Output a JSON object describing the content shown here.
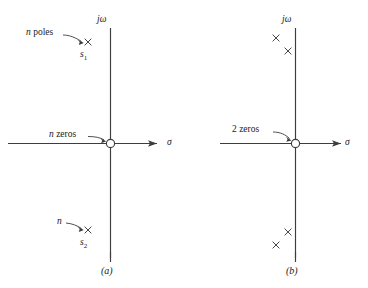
{
  "figure": {
    "ink_color": "#3d3d3d",
    "background_color": "#ffffff"
  },
  "panels": [
    {
      "id": "panel-a",
      "caption": "(a)",
      "axes": {
        "vertical_label": "jω",
        "horizontal_label": "σ"
      },
      "annotations": [
        {
          "id": "n-poles",
          "text": "n poles",
          "italic_part": "n",
          "roman_part": "poles"
        },
        {
          "id": "n-zeros",
          "text": "n zeros",
          "italic_part": "n",
          "roman_part": "zeros"
        },
        {
          "id": "n-lower",
          "text": "n",
          "italic_part": "n",
          "roman_part": ""
        }
      ],
      "points": [
        {
          "id": "s1",
          "label": "s",
          "subscript": "1",
          "marker": "cross",
          "quadrant": "upper-left"
        },
        {
          "id": "s2",
          "label": "s",
          "subscript": "2",
          "marker": "cross",
          "quadrant": "lower-left"
        },
        {
          "id": "origin-zeros",
          "label": "",
          "subscript": "",
          "marker": "circle",
          "quadrant": "origin"
        }
      ],
      "pole_count_text": "n",
      "zero_count_text": "n"
    },
    {
      "id": "panel-b",
      "caption": "(b)",
      "axes": {
        "vertical_label": "jω",
        "horizontal_label": "σ"
      },
      "annotations": [
        {
          "id": "two-zeros",
          "text": "2 zeros",
          "italic_part": "",
          "roman_part": "2 zeros"
        }
      ],
      "points": [
        {
          "id": "p1",
          "label": "",
          "subscript": "",
          "marker": "cross",
          "quadrant": "upper-left"
        },
        {
          "id": "p2",
          "label": "",
          "subscript": "",
          "marker": "cross",
          "quadrant": "upper-left"
        },
        {
          "id": "p3",
          "label": "",
          "subscript": "",
          "marker": "cross",
          "quadrant": "lower-left"
        },
        {
          "id": "p4",
          "label": "",
          "subscript": "",
          "marker": "cross",
          "quadrant": "lower-left"
        },
        {
          "id": "origin-zeros",
          "label": "",
          "subscript": "",
          "marker": "circle",
          "quadrant": "origin"
        }
      ],
      "pole_count_text": "4",
      "zero_count_text": "2"
    }
  ],
  "labels": {
    "a_n_poles_italic": "n",
    "a_n_poles_roman": "poles",
    "a_n_zeros_italic": "n",
    "a_n_zeros_roman": "zeros",
    "a_n_lower": "n",
    "a_s1_base": "s",
    "a_s1_sub": "1",
    "a_s2_base": "s",
    "a_s2_sub": "2",
    "a_jomega": "jω",
    "a_sigma": "σ",
    "a_caption": "(a)",
    "b_two_zeros": "2 zeros",
    "b_jomega": "jω",
    "b_sigma": "σ",
    "b_caption": "(b)"
  }
}
